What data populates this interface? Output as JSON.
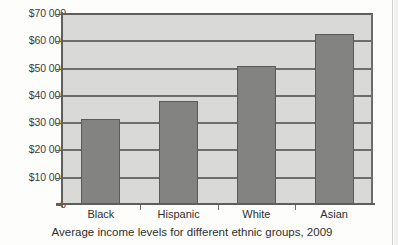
{
  "chart_data": {
    "type": "bar",
    "title": "",
    "caption": "Average income levels for different ethnic groups, 2009",
    "xlabel": "",
    "ylabel": "",
    "categories": [
      "Black",
      "Hispanic",
      "White",
      "Asian"
    ],
    "values": [
      31500,
      38300,
      51100,
      62500
    ],
    "ylim": [
      0,
      70000
    ],
    "ytick_values": [
      70000,
      60000,
      50000,
      40000,
      30000,
      20000,
      10000,
      0
    ],
    "ytick_labels": [
      "$70 000",
      "$60 000",
      "$50 000",
      "$40 000",
      "$30 000",
      "$20 000",
      "$10 000",
      "0"
    ],
    "grid": true,
    "legend": "none",
    "colors": {
      "bar_fill": "#838381",
      "bar_outline": "#5a5a58",
      "plot_background": "#d9d9d7",
      "gridline": "#6d6d6b",
      "axis": "#5e5e5c",
      "text": "#2f2f2d",
      "page_background": "#fdfdfc"
    }
  }
}
